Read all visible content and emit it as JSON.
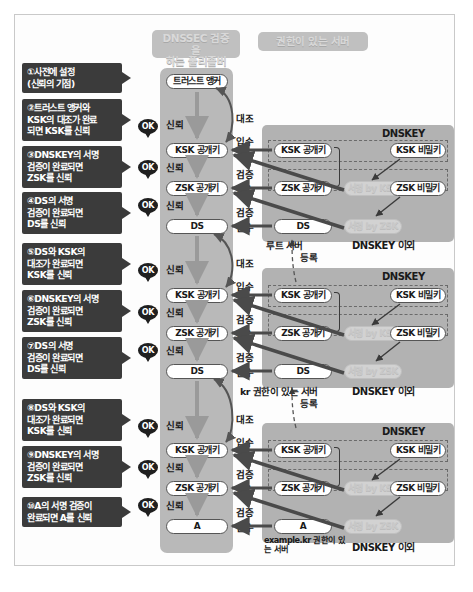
{
  "diagram": {
    "title_resolver": "DNSSEC 검증을\n하는 풀리졸버",
    "title_resolver_line1": "DNSSEC 검증을",
    "title_resolver_line2": "하는 풀리졸버",
    "title_auth": "권한이 있는 서버"
  },
  "callouts": [
    {
      "id": "c1",
      "line1": "①사전에 설정",
      "line2": "(신뢰의 기점)",
      "line3": ""
    },
    {
      "id": "c2",
      "line1": "②트러스트 앵커와",
      "line2": "KSK의 대조가 완료",
      "line3": "되면 KSK를 신뢰"
    },
    {
      "id": "c3",
      "line1": "③DNSKEY의 서명",
      "line2": "검증이 완료되면",
      "line3": "ZSK를 신뢰"
    },
    {
      "id": "c4",
      "line1": "④DS의 서명",
      "line2": "검증이 완료되면",
      "line3": "DS를 신뢰"
    },
    {
      "id": "c5",
      "line1": "⑤DS와 KSK의",
      "line2": "대조가 완료되면",
      "line3": "KSK를 신뢰"
    },
    {
      "id": "c6",
      "line1": "⑥DNSKEY의 서명",
      "line2": "검증이 완료되면",
      "line3": "ZSK를 신뢰"
    },
    {
      "id": "c7",
      "line1": "⑦DS의 서명",
      "line2": "검증이 완료되면",
      "line3": "DS를 신뢰"
    },
    {
      "id": "c8",
      "line1": "⑧DS와 KSK의",
      "line2": "대조가 완료되면",
      "line3": "KSK를 신뢰"
    },
    {
      "id": "c9",
      "line1": "⑨DNSKEY의 서명",
      "line2": "검증이 완료되면",
      "line3": "ZSK를 신뢰"
    },
    {
      "id": "c10",
      "line1": "⑩A의 서명 검증이",
      "line2": "완료되면 A를 신뢰",
      "line3": ""
    }
  ],
  "resolver_nodes": [
    {
      "id": "r_anchor",
      "label": "트러스트 앵커"
    },
    {
      "id": "r_ksk1",
      "label": "KSK 공개키"
    },
    {
      "id": "r_zsk1",
      "label": "ZSK 공개키"
    },
    {
      "id": "r_ds1",
      "label": "DS"
    },
    {
      "id": "r_ksk2",
      "label": "KSK 공개키"
    },
    {
      "id": "r_zsk2",
      "label": "ZSK 공개키"
    },
    {
      "id": "r_ds2",
      "label": "DS"
    },
    {
      "id": "r_ksk3",
      "label": "KSK 공개키"
    },
    {
      "id": "r_zsk3",
      "label": "ZSK 공개키"
    },
    {
      "id": "r_a",
      "label": "A"
    }
  ],
  "ok_badges": [
    {
      "id": "ok1",
      "label": "OK"
    },
    {
      "id": "ok2",
      "label": "OK"
    },
    {
      "id": "ok3",
      "label": "OK"
    },
    {
      "id": "ok4",
      "label": "OK"
    },
    {
      "id": "ok5",
      "label": "OK"
    },
    {
      "id": "ok6",
      "label": "OK"
    },
    {
      "id": "ok7",
      "label": "OK"
    },
    {
      "id": "ok8",
      "label": "OK"
    },
    {
      "id": "ok9",
      "label": "OK"
    }
  ],
  "trust_labels": [
    {
      "id": "t1",
      "label": "신뢰"
    },
    {
      "id": "t2",
      "label": "신뢰"
    },
    {
      "id": "t3",
      "label": "신뢰"
    },
    {
      "id": "t4",
      "label": "신뢰"
    },
    {
      "id": "t5",
      "label": "신뢰"
    },
    {
      "id": "t6",
      "label": "신뢰"
    },
    {
      "id": "t7",
      "label": "신뢰"
    },
    {
      "id": "t8",
      "label": "신뢰"
    },
    {
      "id": "t9",
      "label": "신뢰"
    }
  ],
  "action_labels": [
    {
      "id": "a1",
      "label": "대조"
    },
    {
      "id": "a2",
      "label": "입수"
    },
    {
      "id": "a3",
      "label": "검증"
    },
    {
      "id": "a4",
      "label": "입수"
    },
    {
      "id": "a5",
      "label": "검증"
    },
    {
      "id": "a6",
      "label": "입수"
    },
    {
      "id": "a7",
      "label": "대조"
    },
    {
      "id": "a8",
      "label": "입수"
    },
    {
      "id": "a9",
      "label": "검증"
    },
    {
      "id": "a10",
      "label": "입수"
    },
    {
      "id": "a11",
      "label": "검증"
    },
    {
      "id": "a12",
      "label": "입수"
    },
    {
      "id": "a13",
      "label": "대조"
    },
    {
      "id": "a14",
      "label": "입수"
    },
    {
      "id": "a15",
      "label": "검증"
    },
    {
      "id": "a16",
      "label": "입수"
    },
    {
      "id": "a17",
      "label": "검증"
    },
    {
      "id": "a18",
      "label": "입수"
    }
  ],
  "zones": [
    {
      "id": "zone_root",
      "server_label": "루트 서버",
      "dnskey_title": "DNSKEY",
      "other_title": "DNSKEY 이외",
      "ksk_pub": "KSK 공개키",
      "zsk_pub": "ZSK 공개키",
      "sig_ksk": "서명 by KSK",
      "ksk_priv": "KSK 비밀키",
      "zsk_priv": "ZSK 비밀키",
      "ds": "DS",
      "sig_zsk": "서명 by ZSK"
    },
    {
      "id": "zone_kr",
      "server_label": "kr 권한이 있는 서버",
      "dnskey_title": "DNSKEY",
      "other_title": "DNSKEY 이외",
      "ksk_pub": "KSK 공개키",
      "zsk_pub": "ZSK 공개키",
      "sig_ksk": "서명 by KSK",
      "ksk_priv": "KSK 비밀키",
      "zsk_priv": "ZSK 비밀키",
      "ds": "DS",
      "sig_zsk": "서명 by ZSK"
    },
    {
      "id": "zone_example",
      "server_label_line1": "example.kr 권한이",
      "server_label_line2": "있는 서버",
      "dnskey_title": "DNSKEY",
      "other_title": "DNSKEY 이외",
      "ksk_pub": "KSK 공개키",
      "zsk_pub": "ZSK 공개키",
      "sig_ksk": "서명 by KSK",
      "ksk_priv": "KSK 비밀키",
      "zsk_priv": "ZSK 비밀키",
      "a_record": "A",
      "sig_zsk": "서명 by ZSK"
    }
  ],
  "register_labels": [
    {
      "id": "reg1",
      "label": "등록"
    },
    {
      "id": "reg2",
      "label": "등록"
    }
  ],
  "colors": {
    "callout_bg": "#3b3b3b",
    "band_resolver": "#b9b9b9",
    "band_auth": "#b2b2b2",
    "heading_bg": "#c0c0c0",
    "arrow": "#4a4a4a",
    "page_bg": "#ffffff"
  }
}
